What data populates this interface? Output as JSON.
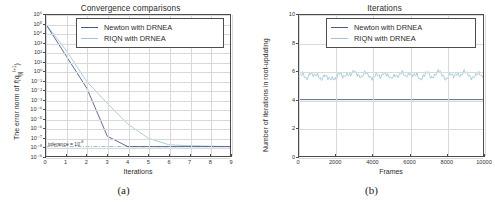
{
  "figure": {
    "panels": [
      {
        "caption": "(a)",
        "title": "Convergence comparisons",
        "xlabel": "Iterations",
        "ylabel_html": "The error norm of f(q[i]^(l+1))",
        "annotation": "tolerance = 10",
        "annotation_exp": "-8"
      },
      {
        "caption": "(b)",
        "title": "Iterations",
        "xlabel": "Frames",
        "ylabel_html": "Number of iterations in root-updating"
      }
    ]
  },
  "legend": {
    "newton": "Newton with DRNEA",
    "riqn": "RIQN with DRNEA"
  },
  "colors": {
    "newton": "#4a5a86",
    "riqn": "#9fc6d8",
    "axis": "#4c4c4c",
    "grid": "#d9d9d9",
    "tolerance": "#6b8fb0"
  },
  "chart_data": [
    {
      "type": "line",
      "title": "Convergence comparisons",
      "xlabel": "Iterations",
      "ylabel": "The error norm of f(q[i]^(l+1))",
      "xlim": [
        0,
        9
      ],
      "ylim_exp": [
        -9,
        6
      ],
      "yscale": "log",
      "grid": true,
      "legend_position": "top-right",
      "xticks": [
        0,
        1,
        2,
        3,
        4,
        5,
        6,
        7,
        8,
        9
      ],
      "yticks_exp": [
        6,
        5,
        4,
        3,
        2,
        1,
        0,
        -1,
        -2,
        -3,
        -4,
        -5,
        -6,
        -7,
        -8,
        -9
      ],
      "ytick_labels": [
        "10⁶",
        "10⁵",
        "10⁴",
        "10³",
        "10²",
        "10¹",
        "10⁰",
        "10⁻¹",
        "10⁻²",
        "10⁻³",
        "10⁻⁴",
        "10⁻⁵",
        "10⁻⁶",
        "10⁻⁷",
        "10⁻⁸",
        "10⁻⁹"
      ],
      "annotations": [
        {
          "text": "tolerance = 10⁻⁸",
          "x": 0.15,
          "y_exp": -7.6
        }
      ],
      "reference_lines": [
        {
          "name": "tolerance",
          "y_exp": -8,
          "style": "dash-dot"
        }
      ],
      "series": [
        {
          "name": "Newton with DRNEA",
          "x": [
            0,
            1,
            2,
            3,
            4,
            5,
            6,
            7,
            8,
            9
          ],
          "y_exp": [
            5.0,
            1.6,
            -1.8,
            -6.9,
            -8.0,
            -8.0,
            -8.0,
            -8.0,
            -8.0,
            -8.0
          ]
        },
        {
          "name": "RIQN with DRNEA",
          "x": [
            0,
            1,
            2,
            3,
            4,
            5,
            6,
            7,
            8,
            9
          ],
          "y_exp": [
            5.0,
            2.2,
            -1.1,
            -3.4,
            -5.6,
            -7.1,
            -7.8,
            -7.9,
            -7.95,
            -8.0
          ]
        }
      ]
    },
    {
      "type": "line",
      "title": "Iterations",
      "xlabel": "Frames",
      "ylabel": "Number of iterations in root-updating",
      "xlim": [
        0,
        10000
      ],
      "ylim": [
        0,
        10
      ],
      "grid": true,
      "legend_position": "top-right",
      "xticks": [
        0,
        2000,
        4000,
        6000,
        8000,
        10000
      ],
      "yticks": [
        0,
        2,
        4,
        6,
        8,
        10
      ],
      "series": [
        {
          "name": "Newton with DRNEA",
          "constant": 4,
          "x": [
            0,
            10000
          ],
          "y": [
            4,
            4
          ]
        },
        {
          "name": "RIQN with DRNEA",
          "mean": 5.72,
          "noise_amplitude": 0.33,
          "x": [
            0,
            200,
            400,
            600,
            800,
            1000,
            1200,
            1400,
            1600,
            1800,
            2000,
            2200,
            2400,
            2600,
            2800,
            3000,
            3200,
            3400,
            3600,
            3800,
            4000,
            4200,
            4400,
            4600,
            4800,
            5000,
            5200,
            5400,
            5600,
            5800,
            6000,
            6200,
            6400,
            6600,
            6800,
            7000,
            7200,
            7400,
            7600,
            7800,
            8000,
            8200,
            8400,
            8600,
            8800,
            9000,
            9200,
            9400,
            9600,
            9800,
            10000
          ],
          "y": [
            5.6,
            5.8,
            5.5,
            5.9,
            5.6,
            5.8,
            5.5,
            5.7,
            5.4,
            5.6,
            5.5,
            5.8,
            5.6,
            5.9,
            5.7,
            6.0,
            5.8,
            5.6,
            5.9,
            5.7,
            5.5,
            5.8,
            5.6,
            5.9,
            5.7,
            5.5,
            5.8,
            5.6,
            5.9,
            5.7,
            5.9,
            5.6,
            5.8,
            5.5,
            5.7,
            5.9,
            5.6,
            5.8,
            6.0,
            5.7,
            5.5,
            5.8,
            5.6,
            5.9,
            5.7,
            6.0,
            5.8,
            5.5,
            5.7,
            5.9,
            5.6
          ]
        }
      ]
    }
  ]
}
